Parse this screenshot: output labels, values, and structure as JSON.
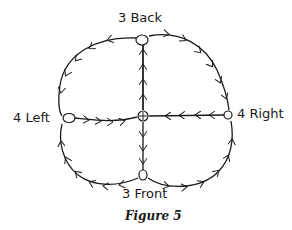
{
  "figure": {
    "caption": "Figure 5",
    "nodes": {
      "back": {
        "label": "3 Back"
      },
      "left": {
        "label": "4 Left"
      },
      "right": {
        "label": "4 Right"
      },
      "front": {
        "label": "3 Front"
      },
      "center": {
        "label": ""
      }
    },
    "edges": [
      {
        "from": "center",
        "to": "back",
        "shape": "straight"
      },
      {
        "from": "back",
        "to": "left",
        "shape": "curve"
      },
      {
        "from": "back",
        "to": "right",
        "shape": "curve"
      },
      {
        "from": "left",
        "to": "center",
        "shape": "straight"
      },
      {
        "from": "right",
        "to": "center",
        "shape": "straight"
      },
      {
        "from": "center",
        "to": "front",
        "shape": "straight"
      },
      {
        "from": "left",
        "to": "front",
        "shape": "curve",
        "direction": "front-to-left"
      },
      {
        "from": "front",
        "to": "right",
        "shape": "curve"
      }
    ],
    "colors": {
      "ink": "#1a1a1a",
      "background": "#ffffff"
    }
  }
}
